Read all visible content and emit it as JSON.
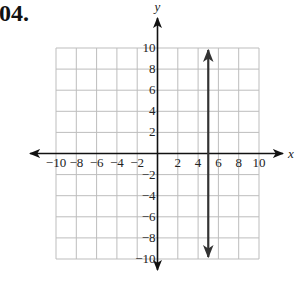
{
  "problem": {
    "number_label": "04."
  },
  "chart_data": {
    "type": "line",
    "title": "",
    "xlabel": "x",
    "ylabel": "y",
    "xlim": [
      -10,
      10
    ],
    "ylim": [
      -10,
      10
    ],
    "grid": true,
    "grid_step": 2,
    "x_ticks": [
      -10,
      -8,
      -6,
      -4,
      -2,
      2,
      4,
      6,
      8,
      10
    ],
    "y_ticks": [
      10,
      8,
      6,
      4,
      2,
      -2,
      -4,
      -6,
      -8,
      -10
    ],
    "x_tick_labels": [
      "−10",
      "−8",
      "−6",
      "−4",
      "−2",
      "2",
      "4",
      "6",
      "8",
      "10"
    ],
    "y_tick_labels": [
      "10",
      "8",
      "6",
      "4",
      "2",
      "−2",
      "−4",
      "−6",
      "−8",
      "−10"
    ],
    "series": [
      {
        "name": "x = 5",
        "description": "Vertical line with arrowheads at both ends",
        "points": [
          {
            "x": 5,
            "y": 10
          },
          {
            "x": 5,
            "y": -10
          }
        ],
        "color": "#333333"
      }
    ],
    "colors": {
      "grid": "#bdbdbd",
      "axis": "#111111",
      "line": "#333333"
    }
  }
}
